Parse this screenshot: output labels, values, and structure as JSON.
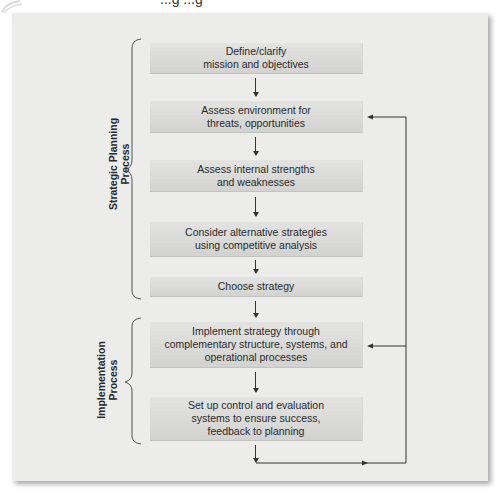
{
  "diagram": {
    "title_partial": "...g ...g",
    "colors": {
      "panel_bg": "#ececeb",
      "box_bg": "#d9d9d8",
      "line": "#333333",
      "text": "#2a2a2a"
    },
    "groups": [
      {
        "id": "strategic-planning",
        "label": "Strategic Planning\nProcess"
      },
      {
        "id": "implementation",
        "label": "Implementation\nProcess"
      }
    ],
    "steps": [
      {
        "id": 1,
        "group": "strategic-planning",
        "label": "Define/clarify\nmission and objectives"
      },
      {
        "id": 2,
        "group": "strategic-planning",
        "label": "Assess environment for\nthreats, opportunities"
      },
      {
        "id": 3,
        "group": "strategic-planning",
        "label": "Assess internal strengths\nand weaknesses"
      },
      {
        "id": 4,
        "group": "strategic-planning",
        "label": "Consider alternative strategies\nusing competitive analysis"
      },
      {
        "id": 5,
        "group": "strategic-planning",
        "label": "Choose strategy"
      },
      {
        "id": 6,
        "group": "implementation",
        "label": "Implement strategy through\ncomplementary structure, systems, and\noperational processes"
      },
      {
        "id": 7,
        "group": "implementation",
        "label": "Set up control and evaluation\nsystems to ensure success,\nfeedback to planning"
      }
    ],
    "edges": [
      {
        "from": 1,
        "to": 2
      },
      {
        "from": 2,
        "to": 3
      },
      {
        "from": 3,
        "to": 4
      },
      {
        "from": 4,
        "to": 5
      },
      {
        "from": 5,
        "to": 6
      },
      {
        "from": 6,
        "to": 7
      },
      {
        "from": 7,
        "to": 2,
        "type": "feedback"
      },
      {
        "from": 7,
        "to": 6,
        "type": "feedback"
      }
    ]
  }
}
